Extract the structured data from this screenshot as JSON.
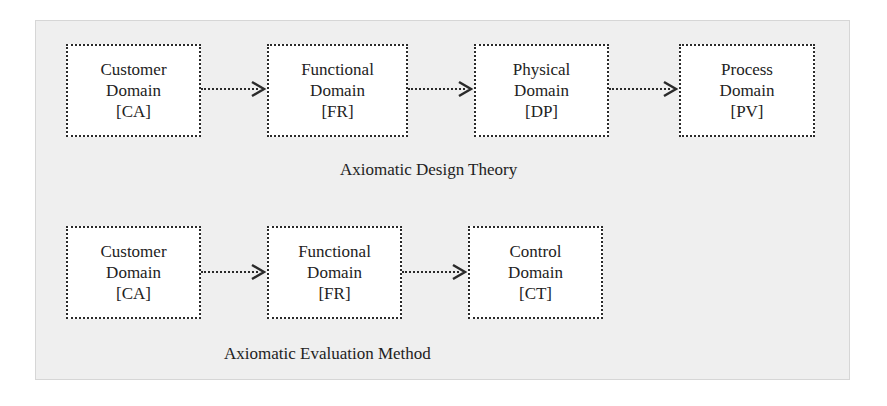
{
  "diagram": {
    "top_row": {
      "caption": "Axiomatic Design Theory",
      "boxes": [
        {
          "line1": "Customer",
          "line2": "Domain",
          "code": "[CA]"
        },
        {
          "line1": "Functional",
          "line2": "Domain",
          "code": "[FR]"
        },
        {
          "line1": "Physical",
          "line2": "Domain",
          "code": "[DP]"
        },
        {
          "line1": "Process",
          "line2": "Domain",
          "code": "[PV]"
        }
      ]
    },
    "bottom_row": {
      "caption": "Axiomatic Evaluation Method",
      "boxes": [
        {
          "line1": "Customer",
          "line2": "Domain",
          "code": "[CA]"
        },
        {
          "line1": "Functional",
          "line2": "Domain",
          "code": "[FR]"
        },
        {
          "line1": "Control",
          "line2": "Domain",
          "code": "[CT]"
        }
      ]
    },
    "colors": {
      "frame_fill": "#efefef",
      "box_fill": "#ffffff",
      "stroke": "#2a2a2a"
    }
  }
}
